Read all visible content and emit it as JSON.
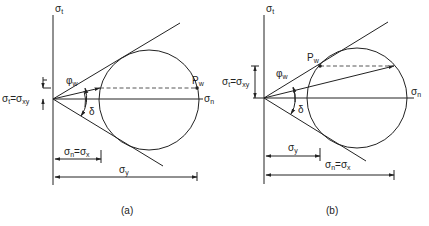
{
  "panels": [
    {
      "id": "a",
      "caption": "(a)",
      "axis_vertical": {
        "sym": "σ",
        "sub": "t"
      },
      "axis_horizontal": {
        "sym": "σ",
        "sub": "n"
      },
      "point_label": {
        "sym": "P",
        "sub": "w"
      },
      "angle_phi": {
        "sym": "φ",
        "sub": "w"
      },
      "angle_delta": "δ",
      "offset_label": {
        "lhs": "σ",
        "lhs_sub": "t",
        "eq": "=",
        "rhs": "σ",
        "rhs_sub": "xy"
      },
      "dim_short": {
        "lhs": "σ",
        "lhs_sub": "n",
        "eq": "=",
        "rhs": "σ",
        "rhs_sub": "x"
      },
      "dim_long": {
        "sym": "σ",
        "sub": "y"
      }
    },
    {
      "id": "b",
      "caption": "(b)",
      "axis_vertical": {
        "sym": "σ",
        "sub": "t"
      },
      "axis_horizontal": {
        "sym": "σ",
        "sub": "n"
      },
      "point_label": {
        "sym": "P",
        "sub": "w"
      },
      "angle_phi": {
        "sym": "φ",
        "sub": "w"
      },
      "angle_delta": "δ",
      "offset_label": {
        "lhs": "σ",
        "lhs_sub": "t",
        "eq": "=",
        "rhs": "σ",
        "rhs_sub": "xy"
      },
      "dim_short": {
        "sym": "σ",
        "sub": "y"
      },
      "dim_long": {
        "lhs": "σ",
        "lhs_sub": "n",
        "eq": "=",
        "rhs": "σ",
        "rhs_sub": "x"
      }
    }
  ]
}
